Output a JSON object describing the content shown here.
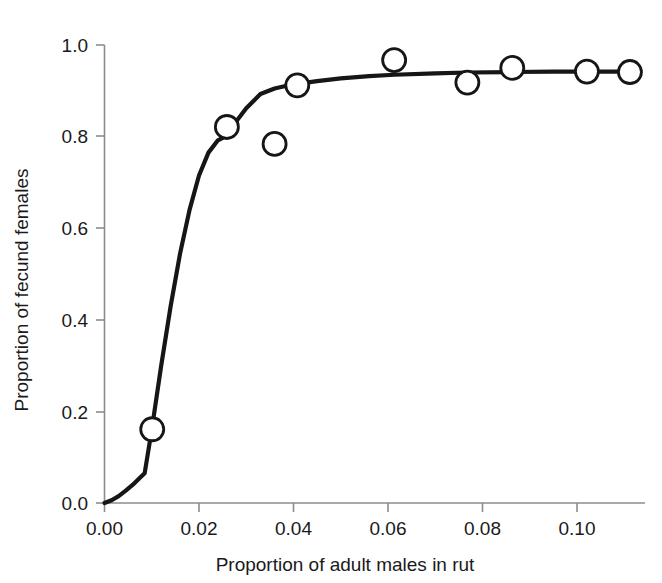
{
  "chart_data": {
    "type": "scatter",
    "title": "",
    "xlabel": "Proportion of adult males in rut",
    "ylabel": "Proportion of fecund females",
    "xlim": [
      0.0,
      0.1155
    ],
    "ylim": [
      0.0,
      1.0
    ],
    "grid": false,
    "legend": "none",
    "xticks": [
      0.0,
      0.02,
      0.04,
      0.06,
      0.08,
      0.1
    ],
    "xticklabels": [
      "0.00",
      "0.02",
      "0.04",
      "0.06",
      "0.08",
      "0.10"
    ],
    "yticks": [
      0.0,
      0.2,
      0.4,
      0.6,
      0.8,
      1.0
    ],
    "yticklabels": [
      "0.0",
      "0.2",
      "0.4",
      "0.6",
      "0.8",
      "1.0"
    ],
    "marker_style": "open-circle",
    "points": [
      {
        "x": 0.0101,
        "y": 0.161
      },
      {
        "x": 0.0259,
        "y": 0.821
      },
      {
        "x": 0.036,
        "y": 0.784
      },
      {
        "x": 0.0408,
        "y": 0.912
      },
      {
        "x": 0.0613,
        "y": 0.967
      },
      {
        "x": 0.0768,
        "y": 0.918
      },
      {
        "x": 0.0863,
        "y": 0.95
      },
      {
        "x": 0.1021,
        "y": 0.942
      },
      {
        "x": 0.1112,
        "y": 0.941
      }
    ],
    "series": [
      {
        "name": "fitted curve",
        "type": "line",
        "x": [
          0.0,
          0.0015,
          0.003,
          0.0045,
          0.006,
          0.0075,
          0.0085,
          0.01,
          0.012,
          0.014,
          0.016,
          0.018,
          0.02,
          0.022,
          0.024,
          0.0255,
          0.0275,
          0.03,
          0.033,
          0.036,
          0.039,
          0.0408,
          0.045,
          0.05,
          0.056,
          0.0613,
          0.07,
          0.0768,
          0.0863,
          0.095,
          0.1021,
          0.1112
        ],
        "y": [
          0.0,
          0.006,
          0.015,
          0.027,
          0.04,
          0.055,
          0.065,
          0.16,
          0.3,
          0.43,
          0.545,
          0.64,
          0.715,
          0.765,
          0.792,
          0.8,
          0.828,
          0.862,
          0.893,
          0.905,
          0.912,
          0.915,
          0.921,
          0.927,
          0.932,
          0.935,
          0.938,
          0.94,
          0.941,
          0.942,
          0.942,
          0.942
        ]
      }
    ]
  },
  "axes": {
    "x_title": "Proportion of adult males in rut",
    "y_title": "Proportion of fecund females",
    "x_tick_labels": [
      "0.00",
      "0.02",
      "0.04",
      "0.06",
      "0.08",
      "0.10"
    ],
    "y_tick_labels": [
      "0.0",
      "0.2",
      "0.4",
      "0.6",
      "0.8",
      "1.0"
    ]
  },
  "colors": {
    "curve": "#161616",
    "marker_stroke": "#161616",
    "marker_fill": "#ffffff",
    "axis": "#8c8c8c",
    "text": "#1a1a1a",
    "background": "#ffffff"
  }
}
